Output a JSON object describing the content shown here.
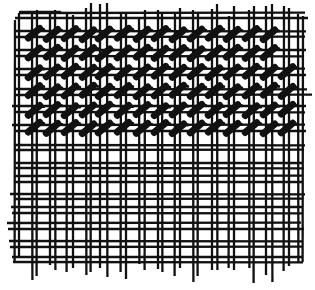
{
  "illustration": {
    "title": "Needlepoint canvas with tent stitches",
    "width": 315,
    "height": 290,
    "colors": {
      "background": "#ffffff",
      "ink": "#111111"
    },
    "mesh": {
      "vertical_lines": [
        {
          "x": 15,
          "y1": 20,
          "y2": 262
        },
        {
          "x": 19,
          "y1": 13,
          "y2": 257
        },
        {
          "x": 32,
          "y1": 14,
          "y2": 280
        },
        {
          "x": 37,
          "y1": 10,
          "y2": 276
        },
        {
          "x": 50,
          "y1": 14,
          "y2": 265
        },
        {
          "x": 55,
          "y1": 10,
          "y2": 270
        },
        {
          "x": 67,
          "y1": 12,
          "y2": 272
        },
        {
          "x": 73,
          "y1": 15,
          "y2": 268
        },
        {
          "x": 86,
          "y1": 8,
          "y2": 275
        },
        {
          "x": 91,
          "y1": 3,
          "y2": 272
        },
        {
          "x": 100,
          "y1": 4,
          "y2": 268
        },
        {
          "x": 107,
          "y1": 3,
          "y2": 277
        },
        {
          "x": 121,
          "y1": 14,
          "y2": 272
        },
        {
          "x": 126,
          "y1": 12,
          "y2": 279
        },
        {
          "x": 139,
          "y1": 18,
          "y2": 264
        },
        {
          "x": 145,
          "y1": 10,
          "y2": 270
        },
        {
          "x": 158,
          "y1": 10,
          "y2": 269
        },
        {
          "x": 162,
          "y1": 14,
          "y2": 272
        },
        {
          "x": 175,
          "y1": 14,
          "y2": 276
        },
        {
          "x": 180,
          "y1": 8,
          "y2": 268
        },
        {
          "x": 193,
          "y1": 10,
          "y2": 282
        },
        {
          "x": 198,
          "y1": 12,
          "y2": 276
        },
        {
          "x": 212,
          "y1": 9,
          "y2": 270
        },
        {
          "x": 217,
          "y1": 4,
          "y2": 270
        },
        {
          "x": 229,
          "y1": 16,
          "y2": 268
        },
        {
          "x": 234,
          "y1": 6,
          "y2": 270
        },
        {
          "x": 249,
          "y1": 10,
          "y2": 268
        },
        {
          "x": 254,
          "y1": 6,
          "y2": 283
        },
        {
          "x": 266,
          "y1": 6,
          "y2": 275
        },
        {
          "x": 272,
          "y1": 4,
          "y2": 282
        },
        {
          "x": 284,
          "y1": 6,
          "y2": 271
        },
        {
          "x": 289,
          "y1": 8,
          "y2": 266
        },
        {
          "x": 298,
          "y1": 14,
          "y2": 262
        },
        {
          "x": 303,
          "y1": 16,
          "y2": 262
        }
      ],
      "horizontal_lines": [
        {
          "y": 13,
          "x1": 20,
          "x2": 305
        },
        {
          "y": 18,
          "x1": 15,
          "x2": 308
        },
        {
          "y": 31,
          "x1": 15,
          "x2": 306
        },
        {
          "y": 37,
          "x1": 15,
          "x2": 305
        },
        {
          "y": 50,
          "x1": 14,
          "x2": 306
        },
        {
          "y": 56,
          "x1": 15,
          "x2": 304
        },
        {
          "y": 69,
          "x1": 15,
          "x2": 305
        },
        {
          "y": 75,
          "x1": 14,
          "x2": 306
        },
        {
          "y": 89,
          "x1": 14,
          "x2": 307
        },
        {
          "y": 95,
          "x1": 15,
          "x2": 312
        },
        {
          "y": 106,
          "x1": 12,
          "x2": 306
        },
        {
          "y": 112,
          "x1": 14,
          "x2": 305
        },
        {
          "y": 125,
          "x1": 12,
          "x2": 305
        },
        {
          "y": 131,
          "x1": 15,
          "x2": 306
        },
        {
          "y": 145,
          "x1": 14,
          "x2": 305
        },
        {
          "y": 150,
          "x1": 15,
          "x2": 304
        },
        {
          "y": 163,
          "x1": 16,
          "x2": 303
        },
        {
          "y": 168,
          "x1": 15,
          "x2": 304
        },
        {
          "y": 176,
          "x1": 14,
          "x2": 302
        },
        {
          "y": 182,
          "x1": 15,
          "x2": 303
        },
        {
          "y": 194,
          "x1": 10,
          "x2": 305
        },
        {
          "y": 199,
          "x1": 14,
          "x2": 303
        },
        {
          "y": 207,
          "x1": 11,
          "x2": 302
        },
        {
          "y": 213,
          "x1": 12,
          "x2": 303
        },
        {
          "y": 223,
          "x1": 7,
          "x2": 301
        },
        {
          "y": 229,
          "x1": 8,
          "x2": 304
        },
        {
          "y": 241,
          "x1": 9,
          "x2": 303
        },
        {
          "y": 247,
          "x1": 10,
          "x2": 302
        },
        {
          "y": 257,
          "x1": 12,
          "x2": 302
        },
        {
          "y": 262,
          "x1": 13,
          "x2": 303
        }
      ],
      "top_edge_line": {
        "y": 12,
        "x1": 20,
        "x2": 60
      }
    },
    "stitches": {
      "rows_y": [
        34,
        53,
        72,
        91,
        110,
        128
      ],
      "columns_x": [
        34,
        52,
        70,
        88,
        104,
        123,
        142,
        160,
        178,
        196,
        214,
        232,
        251,
        269,
        287
      ],
      "length": 15,
      "thickness": 7,
      "angle_deg": -40,
      "skip": [
        {
          "row": 0,
          "col": 14
        },
        {
          "row": 1,
          "col": 14
        }
      ]
    }
  }
}
